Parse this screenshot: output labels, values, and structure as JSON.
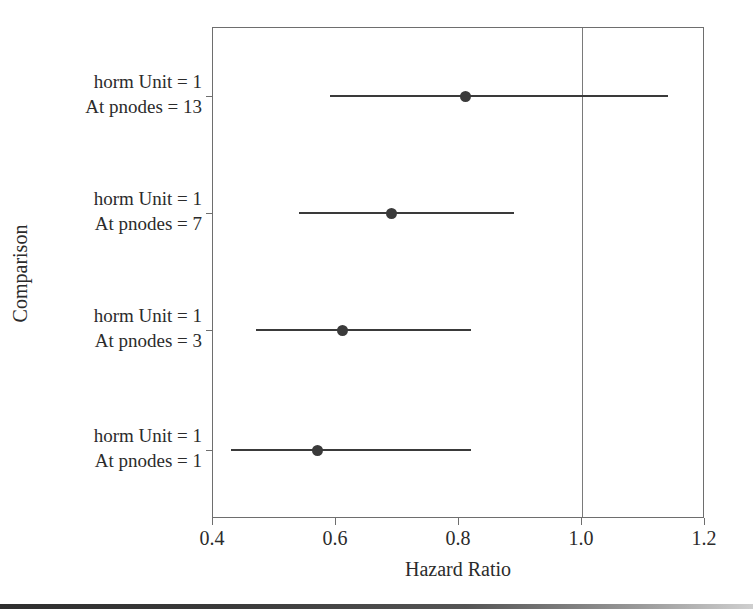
{
  "chart_data": {
    "type": "scatter",
    "subtype": "forest-plot",
    "title": "",
    "xlabel": "Hazard Ratio",
    "ylabel": "Comparison",
    "xlim": [
      0.4,
      1.2
    ],
    "xticks": [
      "0.4",
      "0.6",
      "0.8",
      "1.0",
      "1.2"
    ],
    "xtick_values": [
      0.4,
      0.6,
      0.8,
      1.0,
      1.2
    ],
    "grid": false,
    "legend": "none",
    "reference_line": 1.0,
    "categories": [
      "horm Unit = 1 / At pnodes = 13",
      "horm Unit = 1 / At pnodes = 7",
      "horm Unit = 1 / At pnodes = 3",
      "horm Unit = 1 / At pnodes = 1"
    ],
    "values": [
      0.81,
      0.69,
      0.61,
      0.57
    ],
    "ci_low": [
      0.59,
      0.54,
      0.47,
      0.43
    ],
    "ci_high": [
      1.14,
      0.89,
      0.82,
      0.82
    ],
    "rows": [
      {
        "label_line1": "horm Unit = 1",
        "label_line2": "At pnodes = 13",
        "estimate": 0.81,
        "ci_low": 0.59,
        "ci_high": 1.14
      },
      {
        "label_line1": "horm Unit = 1",
        "label_line2": "At pnodes = 7",
        "estimate": 0.69,
        "ci_low": 0.54,
        "ci_high": 0.89
      },
      {
        "label_line1": "horm Unit = 1",
        "label_line2": "At pnodes = 3",
        "estimate": 0.61,
        "ci_low": 0.47,
        "ci_high": 0.82
      },
      {
        "label_line1": "horm Unit = 1",
        "label_line2": "At pnodes = 1",
        "estimate": 0.57,
        "ci_low": 0.43,
        "ci_high": 0.82
      }
    ],
    "colors": {
      "marker": "#3a3a3a",
      "line": "#3a3a3a",
      "axis": "#6e6e6e",
      "reference_line": "#7a7a7a",
      "background": "#ffffff",
      "text": "#2b2b2b"
    }
  },
  "axis": {
    "x_title": "Hazard Ratio",
    "y_title": "Comparison",
    "x_tick_labels": [
      "0.4",
      "0.6",
      "0.8",
      "1.0",
      "1.2"
    ]
  }
}
